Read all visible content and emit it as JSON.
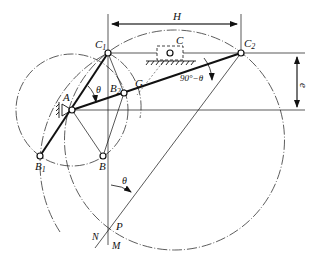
{
  "diagram": {
    "type": "crank-slider mechanism design construction",
    "labels": {
      "A": "A",
      "B": "B",
      "B1": "B",
      "B1_sub": "1",
      "B2": "B",
      "B2_sub": "2",
      "C": "C",
      "C1": "C",
      "C1_sub": "1",
      "C2": "C",
      "C2_sub": "2",
      "G": "G",
      "P": "P",
      "N": "N",
      "M": "M",
      "H": "H",
      "e": "e",
      "theta_at_A": "θ",
      "theta_at_P": "θ",
      "angle_C2": "90°−θ"
    },
    "points": {
      "A": [
        72,
        110
      ],
      "B": [
        103,
        156
      ],
      "B1": [
        40,
        156
      ],
      "B2": [
        124,
        93
      ],
      "C": [
        170,
        53
      ],
      "C1": [
        108,
        53
      ],
      "C2": [
        241,
        53
      ],
      "G": [
        145,
        85
      ],
      "P": [
        109,
        226
      ]
    },
    "colors": {
      "line": "#111111",
      "background": "#ffffff"
    }
  }
}
